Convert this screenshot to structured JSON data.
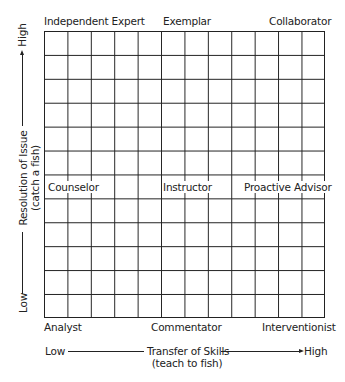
{
  "diagram": {
    "type": "grid-matrix",
    "rows": 12,
    "columns": 12,
    "top_labels": {
      "left": "Independent Expert",
      "center": "Exemplar",
      "right": "Collaborator"
    },
    "middle_labels": {
      "left": "Counselor",
      "center": "Instructor",
      "right": "Proactive Advisor"
    },
    "bottom_labels": {
      "left": "Analyst",
      "center": "Commentator",
      "right": "Interventionist"
    },
    "x_axis": {
      "low": "Low",
      "high": "High",
      "title": "Transfer of Skills",
      "subtitle": "(teach to fish)"
    },
    "y_axis": {
      "low": "Low",
      "high": "High",
      "title": "Resolution of Issue",
      "subtitle": "(catch a fish)"
    },
    "colors": {
      "line": "#222222",
      "background": "#ffffff"
    }
  }
}
